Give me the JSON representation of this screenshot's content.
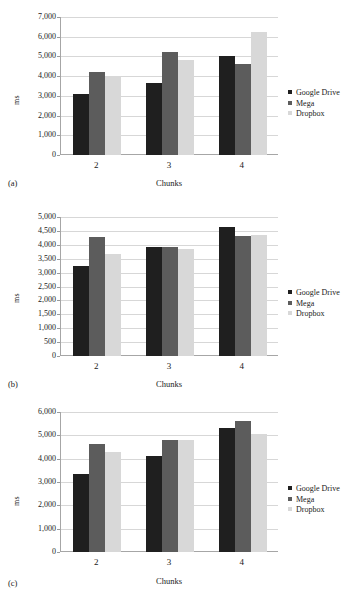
{
  "figure": {
    "series_names": [
      "Google Drive",
      "Mega",
      "Dropbox"
    ],
    "series_colors": [
      "#1f1f1f",
      "#5c5c5c",
      "#d8d8d8"
    ],
    "categories": [
      "2",
      "3",
      "4"
    ],
    "xlabel": "Chunks",
    "ylabel": "ms"
  },
  "panels": [
    {
      "tag": "(a)",
      "ylabel": "ms",
      "xlabel": "Chunks",
      "yticks": [
        "0",
        "1,000",
        "2,000",
        "3,000",
        "4,000",
        "5,000",
        "6,000",
        "7,000"
      ],
      "xticks": [
        "2",
        "3",
        "4"
      ],
      "legend": [
        "Google Drive",
        "Mega",
        "Dropbox"
      ]
    },
    {
      "tag": "(b)",
      "ylabel": "ms",
      "xlabel": "Chunks",
      "yticks": [
        "0",
        "500",
        "1,000",
        "1,500",
        "2,000",
        "2,500",
        "3,000",
        "3,500",
        "4,000",
        "4,500",
        "5,000"
      ],
      "xticks": [
        "2",
        "3",
        "4"
      ],
      "legend": [
        "Google Drive",
        "Mega",
        "Dropbox"
      ]
    },
    {
      "tag": "(c)",
      "ylabel": "ms",
      "xlabel": "Chunks",
      "yticks": [
        "0",
        "1,000",
        "2,000",
        "3,000",
        "4,000",
        "5,000",
        "6,000"
      ],
      "xticks": [
        "2",
        "3",
        "4"
      ],
      "legend": [
        "Google Drive",
        "Mega",
        "Dropbox"
      ]
    }
  ],
  "chart_data": [
    {
      "type": "bar",
      "panel": "(a)",
      "title": "",
      "categories": [
        "2",
        "3",
        "4"
      ],
      "series": [
        {
          "name": "Google Drive",
          "values": [
            3120,
            3650,
            5020
          ]
        },
        {
          "name": "Mega",
          "values": [
            4200,
            5250,
            4600
          ]
        },
        {
          "name": "Dropbox",
          "values": [
            4000,
            4800,
            6250
          ]
        }
      ],
      "xlabel": "Chunks",
      "ylabel": "ms",
      "ylim": [
        0,
        7000
      ],
      "ytick_step": 1000,
      "grid": true,
      "legend_position": "right"
    },
    {
      "type": "bar",
      "panel": "(b)",
      "title": "",
      "categories": [
        "2",
        "3",
        "4"
      ],
      "series": [
        {
          "name": "Google Drive",
          "values": [
            3220,
            3910,
            4630
          ]
        },
        {
          "name": "Mega",
          "values": [
            4280,
            3930,
            4300
          ]
        },
        {
          "name": "Dropbox",
          "values": [
            3670,
            3840,
            4340
          ]
        }
      ],
      "xlabel": "Chunks",
      "ylabel": "ms",
      "ylim": [
        0,
        5000
      ],
      "ytick_step": 500,
      "grid": true,
      "legend_position": "right"
    },
    {
      "type": "bar",
      "panel": "(c)",
      "title": "",
      "categories": [
        "2",
        "3",
        "4"
      ],
      "series": [
        {
          "name": "Google Drive",
          "values": [
            3350,
            4120,
            5300
          ]
        },
        {
          "name": "Mega",
          "values": [
            4620,
            4780,
            5620
          ]
        },
        {
          "name": "Dropbox",
          "values": [
            4300,
            4790,
            5050
          ]
        }
      ],
      "xlabel": "Chunks",
      "ylabel": "ms",
      "ylim": [
        0,
        6000
      ],
      "ytick_step": 1000,
      "grid": true,
      "legend_position": "right"
    }
  ]
}
